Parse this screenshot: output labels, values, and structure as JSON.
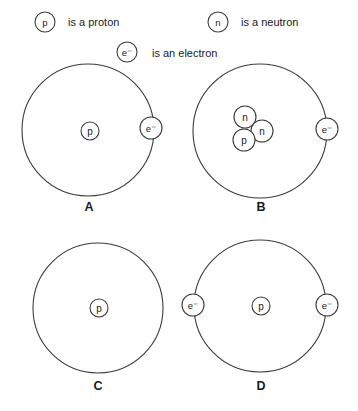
{
  "figure": {
    "background_color": "#ffffff",
    "stroke_color": "#3b3b3b",
    "text_color": "#1a1a1a"
  },
  "legend": {
    "items": [
      {
        "symbol": "p",
        "text": "is a proton",
        "symbol_name": "proton-symbol",
        "cx": 45,
        "cy": 22,
        "r": 10,
        "text_x": 68,
        "text_y": 22
      },
      {
        "symbol": "n",
        "text": "is a neutron",
        "symbol_name": "neutron-symbol",
        "cx": 218,
        "cy": 22,
        "r": 10,
        "text_x": 241,
        "text_y": 22
      },
      {
        "symbol": "e⁻",
        "text": "is an electron",
        "symbol_name": "electron-symbol",
        "cx": 127,
        "cy": 52,
        "r": 10,
        "text_x": 152,
        "text_y": 53
      }
    ]
  },
  "panels": [
    {
      "id": "A",
      "label": "A",
      "label_x": 89,
      "label_y": 207,
      "orbit": {
        "cx": 88,
        "cy": 130,
        "r": 66
      },
      "nucleus": [
        {
          "symbol": "p",
          "name": "proton",
          "cx": 90,
          "cy": 131,
          "r": 9
        }
      ],
      "electrons": [
        {
          "symbol": "e⁻",
          "name": "electron",
          "cx": 151,
          "cy": 128,
          "r": 11
        }
      ]
    },
    {
      "id": "B",
      "label": "B",
      "label_x": 261,
      "label_y": 207,
      "orbit": {
        "cx": 260,
        "cy": 131,
        "r": 67
      },
      "nucleus": [
        {
          "symbol": "n",
          "name": "neutron",
          "cx": 245,
          "cy": 117,
          "r": 11
        },
        {
          "symbol": "n",
          "name": "neutron",
          "cx": 262,
          "cy": 131,
          "r": 11
        },
        {
          "symbol": "p",
          "name": "proton",
          "cx": 244,
          "cy": 140,
          "r": 11
        }
      ],
      "electrons": [
        {
          "symbol": "e⁻",
          "name": "electron",
          "cx": 327,
          "cy": 129,
          "r": 11
        }
      ]
    },
    {
      "id": "C",
      "label": "C",
      "label_x": 98,
      "label_y": 386,
      "orbit": {
        "cx": 98,
        "cy": 308,
        "r": 65
      },
      "nucleus": [
        {
          "symbol": "p",
          "name": "proton",
          "cx": 99,
          "cy": 308,
          "r": 9
        }
      ],
      "electrons": []
    },
    {
      "id": "D",
      "label": "D",
      "label_x": 261,
      "label_y": 386,
      "orbit": {
        "cx": 260,
        "cy": 306,
        "r": 66
      },
      "nucleus": [
        {
          "symbol": "p",
          "name": "proton",
          "cx": 261,
          "cy": 306,
          "r": 9
        }
      ],
      "electrons": [
        {
          "symbol": "e⁻",
          "name": "electron",
          "cx": 193,
          "cy": 305,
          "r": 11
        },
        {
          "symbol": "e⁻",
          "name": "electron",
          "cx": 327,
          "cy": 305,
          "r": 11
        }
      ]
    }
  ]
}
